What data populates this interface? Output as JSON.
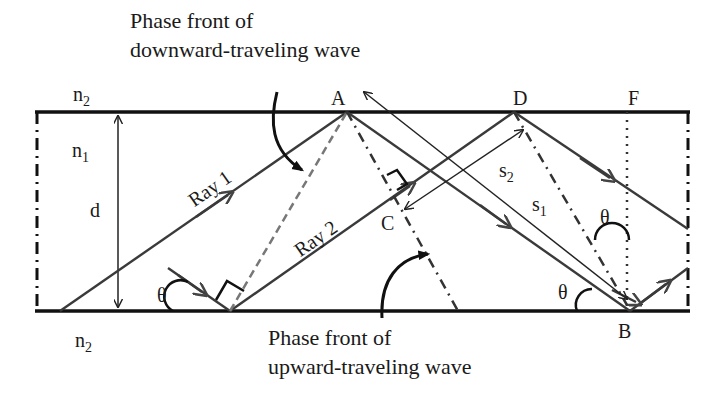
{
  "diagram": {
    "captions": {
      "downward": [
        "Phase front of",
        "downward-traveling wave"
      ],
      "upward": [
        "Phase front of",
        "upward-traveling wave"
      ]
    },
    "media": {
      "top_cladding": {
        "base": "n",
        "sub": "2"
      },
      "core": {
        "base": "n",
        "sub": "1"
      },
      "bottom_cladding": {
        "base": "n",
        "sub": "2"
      }
    },
    "thickness_label": "d",
    "rays": [
      {
        "label": "Ray 1"
      },
      {
        "label": "Ray 2"
      }
    ],
    "points": {
      "A": "A",
      "B": "B",
      "C": "C",
      "D": "D",
      "F": "F"
    },
    "paths": {
      "s1": {
        "base": "s",
        "sub": "1"
      },
      "s2": {
        "base": "s",
        "sub": "2"
      }
    },
    "angle_symbol": "θ",
    "colors": {
      "boundary": "#111111",
      "ray": "#3a3a3a",
      "phase_front_dashed": "#777777",
      "text": "#1a1a1a",
      "background": "#ffffff"
    }
  }
}
